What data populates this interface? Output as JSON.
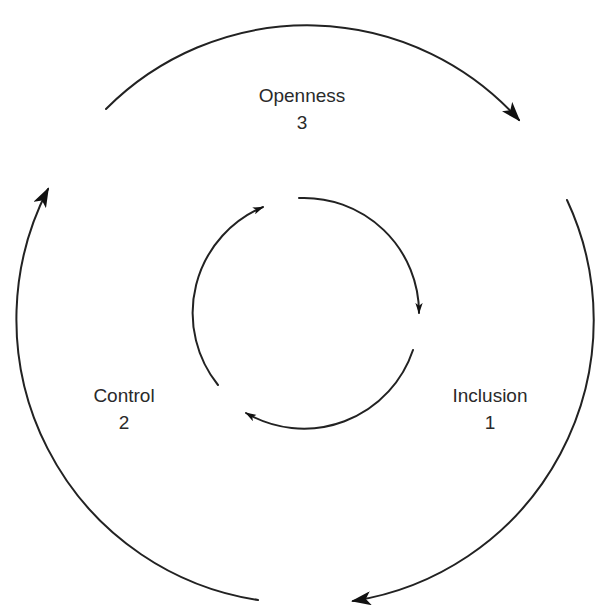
{
  "diagram": {
    "title": "",
    "stages": [
      {
        "name": "Inclusion",
        "number": "1"
      },
      {
        "name": "Control",
        "number": "2"
      },
      {
        "name": "Openness",
        "number": "3"
      }
    ],
    "colors": {
      "background": "#ffffff",
      "stroke": "#222222",
      "text": "#2a2a2a"
    },
    "outer_cycle": {
      "direction": "clockwise",
      "arrows": 3
    },
    "inner_cycle": {
      "direction": "clockwise",
      "arrows": 3
    }
  }
}
